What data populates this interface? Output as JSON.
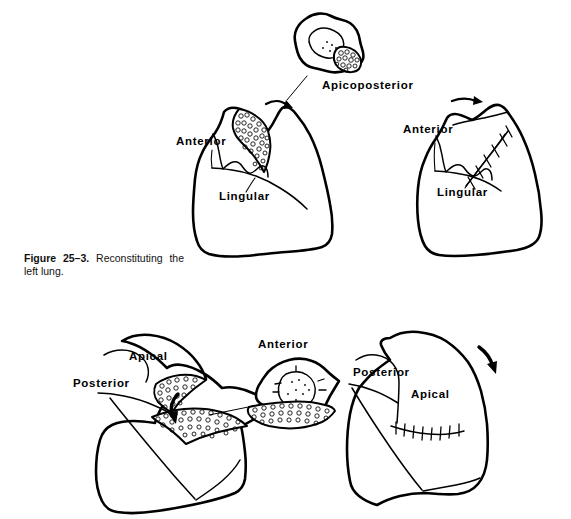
{
  "figure": {
    "caption_label": "Figure 25–3.",
    "caption_text": "Reconstituting the left lung.",
    "ink_color": "#000000",
    "background_color": "#ffffff"
  },
  "panels": [
    {
      "id": "top-segment-specimen",
      "role": "excised-segment-specimen",
      "label": "Apicoposterior",
      "label_x": 322,
      "label_y": 89
    },
    {
      "id": "top-left-lung",
      "role": "lung-with-defect",
      "labels": [
        {
          "text": "Anterior",
          "x": 176,
          "y": 145
        },
        {
          "text": "Lingular",
          "x": 219,
          "y": 200
        }
      ]
    },
    {
      "id": "top-right-lung",
      "role": "lung-reconstituted-sutured",
      "labels": [
        {
          "text": "Anterior",
          "x": 403,
          "y": 133
        },
        {
          "text": "Lingular",
          "x": 437,
          "y": 196
        }
      ]
    },
    {
      "id": "bottom-left-lung",
      "role": "lung-with-defect",
      "labels": [
        {
          "text": "Apical",
          "x": 129,
          "y": 360
        },
        {
          "text": "Posterior",
          "x": 73,
          "y": 387
        }
      ]
    },
    {
      "id": "bottom-middle-specimen",
      "role": "excised-segment-specimen",
      "labels": [
        {
          "text": "Anterior",
          "x": 258,
          "y": 348
        }
      ]
    },
    {
      "id": "bottom-right-lung",
      "role": "lung-reconstituted-sutured",
      "labels": [
        {
          "text": "Posterior",
          "x": 353,
          "y": 376
        },
        {
          "text": "Apical",
          "x": 411,
          "y": 398
        }
      ]
    }
  ],
  "annotations": {
    "arrows": [
      {
        "name": "top-left-rotation-arrow",
        "direction": "clockwise-right"
      },
      {
        "name": "top-right-rotation-arrow",
        "direction": "right"
      },
      {
        "name": "bottom-left-fold-arrow",
        "direction": "down"
      },
      {
        "name": "bottom-right-rotation-arrow",
        "direction": "down-right"
      }
    ],
    "leader_lines": [
      {
        "name": "specimen-leader-top"
      },
      {
        "name": "specimen-leader-bottom"
      }
    ],
    "suture_lines": [
      {
        "name": "top-right-suture",
        "stitch_count": 5
      },
      {
        "name": "bottom-right-suture",
        "stitch_count": 8
      }
    ]
  }
}
